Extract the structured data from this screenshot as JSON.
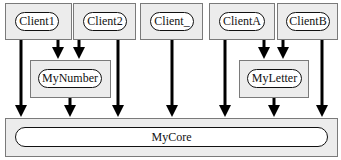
{
  "diagram": {
    "clients": [
      {
        "id": "client1",
        "label": "Client1"
      },
      {
        "id": "client2",
        "label": "Client2"
      },
      {
        "id": "client_",
        "label": "Client_"
      },
      {
        "id": "clienta",
        "label": "ClientA"
      },
      {
        "id": "clientb",
        "label": "ClientB"
      }
    ],
    "middle": [
      {
        "id": "mynumber",
        "label": "MyNumber"
      },
      {
        "id": "myletter",
        "label": "MyLetter"
      }
    ],
    "core": {
      "id": "mycore",
      "label": "MyCore"
    },
    "edges": [
      {
        "from": "Client1",
        "to": "MyCore"
      },
      {
        "from": "Client1",
        "to": "MyNumber"
      },
      {
        "from": "Client2",
        "to": "MyNumber"
      },
      {
        "from": "Client2",
        "to": "MyCore"
      },
      {
        "from": "MyNumber",
        "to": "MyCore"
      },
      {
        "from": "Client_",
        "to": "MyCore"
      },
      {
        "from": "ClientA",
        "to": "MyCore"
      },
      {
        "from": "ClientA",
        "to": "MyLetter"
      },
      {
        "from": "ClientB",
        "to": "MyLetter"
      },
      {
        "from": "MyLetter",
        "to": "MyCore"
      },
      {
        "from": "ClientB",
        "to": "MyCore"
      }
    ]
  }
}
